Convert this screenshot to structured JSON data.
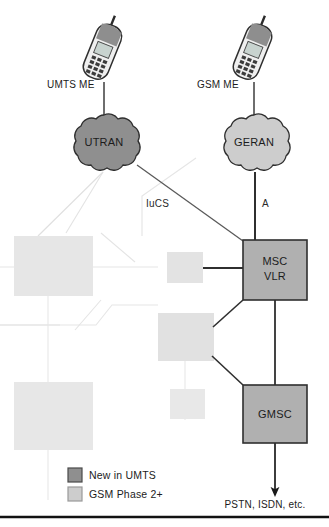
{
  "diagram": {
    "terminals": [
      {
        "id": "umts-me",
        "label": "UMTS ME",
        "icon": "mobile-phone-icon"
      },
      {
        "id": "gsm-me",
        "label": "GSM ME",
        "icon": "mobile-phone-icon"
      }
    ],
    "clouds": [
      {
        "id": "utran",
        "label": "UTRAN",
        "fill": "#8f8f8f",
        "category": "New in UMTS"
      },
      {
        "id": "geran",
        "label": "GERAN",
        "fill": "#cdcdcd",
        "category": "GSM Phase 2+"
      }
    ],
    "boxes": [
      {
        "id": "msc-vlr",
        "line1": "MSC",
        "line2": "VLR",
        "fill": "#b0b0b0",
        "category": "New in UMTS"
      },
      {
        "id": "gmsc",
        "line1": "GMSC",
        "line2": "",
        "fill": "#b0b0b0",
        "category": "New in UMTS"
      }
    ],
    "faded_boxes": [
      {
        "id": "faded-box-left-upper",
        "fill": "#e6e6e6"
      },
      {
        "id": "faded-box-left-lower",
        "fill": "#e6e6e6"
      },
      {
        "id": "faded-box-mid-upper",
        "fill": "#e3e3e3"
      },
      {
        "id": "faded-box-mid-center",
        "fill": "#e1e1e1"
      },
      {
        "id": "faded-box-mid-lower",
        "fill": "#e8e8e8"
      }
    ],
    "interfaces": [
      {
        "id": "iucs",
        "label": "IuCS"
      },
      {
        "id": "a-interface",
        "label": "A"
      }
    ],
    "external_network": {
      "id": "pstn-isdn",
      "label": "PSTN, ISDN, etc."
    }
  },
  "legend": {
    "items": [
      {
        "label": "New in UMTS",
        "color": "#8f8f8f"
      },
      {
        "label": "GSM Phase 2+",
        "color": "#cdcdcd"
      }
    ]
  },
  "colors": {
    "new_in_umts": "#8f8f8f",
    "gsm_phase_2plus": "#cdcdcd",
    "box_fill": "#b0b0b0",
    "stroke": "#3a3a3a",
    "faded_stroke": "#dcdcdc",
    "rule": "#111111"
  }
}
